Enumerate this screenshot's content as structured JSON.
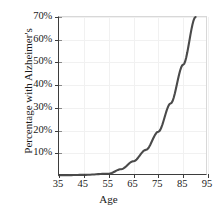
{
  "chart_data": {
    "type": "line",
    "title": "",
    "xlabel": "Age",
    "ylabel": "Percentage with Alzheimer's",
    "xlim": [
      35,
      95
    ],
    "ylim": [
      0,
      70
    ],
    "grid": true,
    "legend": null,
    "x_ticks": [
      35,
      45,
      55,
      65,
      75,
      85,
      95
    ],
    "x_tick_labels": [
      "35",
      "45",
      "55",
      "65",
      "75",
      "85",
      "95"
    ],
    "y_ticks": [
      10,
      20,
      30,
      40,
      50,
      60,
      70
    ],
    "y_tick_labels": [
      "10%",
      "20%",
      "30%",
      "40%",
      "50%",
      "60%",
      "70%"
    ],
    "series": [
      {
        "name": "Percentage with Alzheimer's",
        "color": "#4a4a4a",
        "x": [
          35,
          45,
          55,
          60,
          65,
          70,
          75,
          80,
          85,
          90
        ],
        "values": [
          0.3,
          0.5,
          1.0,
          3.0,
          6.5,
          11.5,
          19.5,
          32.0,
          49.0,
          70.0
        ]
      }
    ]
  },
  "axis": {
    "x_title": "Age",
    "y_title": "Percentage with Alzheimer's"
  },
  "colors": {
    "line": "#4a4a4a",
    "grid": "#f1f1f1",
    "axis": "#3d3d3d",
    "background": "#ffffff"
  }
}
